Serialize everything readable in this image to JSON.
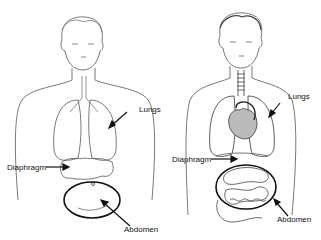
{
  "figures": [
    {
      "name": "simple-figure",
      "labels": {
        "lungs": "Lungs",
        "diaphragm": "Diaphragm",
        "abdomen": "Abdomen"
      }
    },
    {
      "name": "detailed-figure",
      "labels": {
        "lungs": "Lungs",
        "diaphragm": "Diaphragm",
        "abdomen": "Abdomen"
      }
    }
  ]
}
